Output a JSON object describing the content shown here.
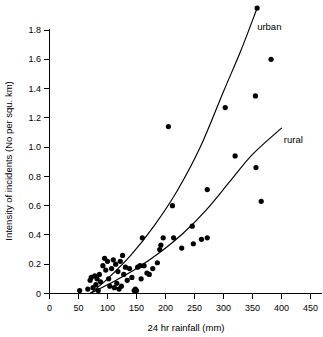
{
  "chart_data": {
    "type": "scatter",
    "title": "",
    "xlabel": "24 hr rainfall (mm)",
    "ylabel": "Intensity of incidents (No per squ. km)",
    "xlim": [
      0,
      450
    ],
    "ylim": [
      0,
      1.9
    ],
    "grid": false,
    "legend_position": "inline-curve-labels",
    "xticks": [
      0,
      50,
      100,
      150,
      200,
      250,
      300,
      350,
      400,
      450
    ],
    "xtick_labels": [
      "0",
      "50",
      "100",
      "150",
      "200",
      "250",
      "300",
      "350",
      "400",
      "450"
    ],
    "yticks": [
      0,
      0.2,
      0.4,
      0.6,
      0.8,
      1.0,
      1.2,
      1.4,
      1.6,
      1.8
    ],
    "ytick_labels": [
      "0",
      "0.2",
      "0.4",
      "0.6",
      "0.8",
      "1.0",
      "1.2",
      "1.4",
      "1.6",
      "1.8"
    ],
    "points": [
      [
        52,
        0.02
      ],
      [
        66,
        0.03
      ],
      [
        70,
        0.09
      ],
      [
        72,
        0.11
      ],
      [
        75,
        0.04
      ],
      [
        78,
        0.12
      ],
      [
        80,
        0.06
      ],
      [
        82,
        0.1
      ],
      [
        84,
        0.02
      ],
      [
        86,
        0.13
      ],
      [
        88,
        0.08
      ],
      [
        92,
        0.19
      ],
      [
        95,
        0.24
      ],
      [
        97,
        0.16
      ],
      [
        100,
        0.22
      ],
      [
        102,
        0.1
      ],
      [
        104,
        0.05
      ],
      [
        107,
        0.17
      ],
      [
        110,
        0.23
      ],
      [
        112,
        0.04
      ],
      [
        114,
        0.2
      ],
      [
        116,
        0.07
      ],
      [
        118,
        0.15
      ],
      [
        120,
        0.03
      ],
      [
        122,
        0.22
      ],
      [
        124,
        0.05
      ],
      [
        126,
        0.26
      ],
      [
        128,
        0.13
      ],
      [
        131,
        0.18
      ],
      [
        134,
        0.09
      ],
      [
        138,
        0.17
      ],
      [
        142,
        0.11
      ],
      [
        146,
        0.02
      ],
      [
        148,
        0.03
      ],
      [
        150,
        0.02
      ],
      [
        152,
        0.18
      ],
      [
        156,
        0.19
      ],
      [
        158,
        0.1
      ],
      [
        160,
        0.38
      ],
      [
        163,
        0.19
      ],
      [
        168,
        0.14
      ],
      [
        172,
        0.13
      ],
      [
        178,
        0.17
      ],
      [
        186,
        0.21
      ],
      [
        190,
        0.3
      ],
      [
        192,
        0.33
      ],
      [
        196,
        0.38
      ],
      [
        205,
        1.14
      ],
      [
        212,
        0.6
      ],
      [
        214,
        0.38
      ],
      [
        228,
        0.31
      ],
      [
        246,
        0.46
      ],
      [
        248,
        0.34
      ],
      [
        262,
        0.37
      ],
      [
        272,
        0.38
      ],
      [
        272,
        0.71
      ],
      [
        303,
        1.27
      ],
      [
        320,
        0.94
      ],
      [
        355,
        1.35
      ],
      [
        356,
        0.86
      ],
      [
        358,
        1.95
      ],
      [
        365,
        0.63
      ],
      [
        382,
        1.6
      ]
    ],
    "series": [
      {
        "name": "urban",
        "label": "urban",
        "label_x": 358,
        "label_y": 1.82,
        "curve_points": [
          [
            70,
            0.0
          ],
          [
            100,
            0.1
          ],
          [
            140,
            0.26
          ],
          [
            180,
            0.46
          ],
          [
            220,
            0.7
          ],
          [
            260,
            1.0
          ],
          [
            300,
            1.38
          ],
          [
            330,
            1.66
          ],
          [
            358,
            1.95
          ]
        ]
      },
      {
        "name": "rural",
        "label": "rural",
        "label_x": 404,
        "label_y": 1.05,
        "curve_points": [
          [
            70,
            0.0
          ],
          [
            110,
            0.08
          ],
          [
            150,
            0.17
          ],
          [
            190,
            0.28
          ],
          [
            230,
            0.41
          ],
          [
            270,
            0.57
          ],
          [
            310,
            0.76
          ],
          [
            350,
            0.95
          ],
          [
            400,
            1.13
          ]
        ]
      }
    ]
  }
}
